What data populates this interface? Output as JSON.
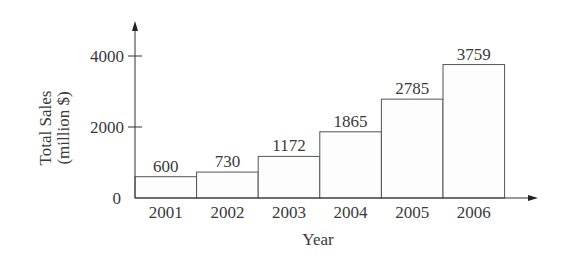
{
  "chart_data": {
    "type": "bar",
    "title": "",
    "xlabel": "Year",
    "ylabel": [
      "Total Sales",
      "(million $)"
    ],
    "categories": [
      "2001",
      "2002",
      "2003",
      "2004",
      "2005",
      "2006"
    ],
    "values": [
      600,
      730,
      1172,
      1865,
      2785,
      3759
    ],
    "data_labels": [
      "600",
      "730",
      "1172",
      "1865",
      "2785",
      "3759"
    ],
    "yticks": [
      0,
      2000,
      4000
    ],
    "ytick_labels": [
      "0",
      "2000",
      "4000"
    ],
    "ylim": [
      0,
      4000
    ],
    "grid": false,
    "legend": null,
    "colors": {
      "bar_fill": "#fdfdfd",
      "bar_stroke": "#555555",
      "axis": "#333333",
      "text": "#3a3a3a"
    }
  }
}
